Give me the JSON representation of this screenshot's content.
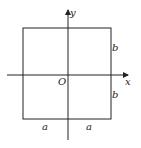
{
  "diagram": {
    "type": "coordinate-figure",
    "axes": {
      "x_label": "x",
      "y_label": "y",
      "origin_label": "O"
    },
    "rectangle": {
      "half_width_label": "a",
      "half_height_label": "b"
    },
    "labels": {
      "bottom_left": "a",
      "bottom_right": "a",
      "right_top": "b",
      "right_bottom": "b"
    },
    "colors": {
      "line": "#222222",
      "background": "#ffffff"
    }
  }
}
